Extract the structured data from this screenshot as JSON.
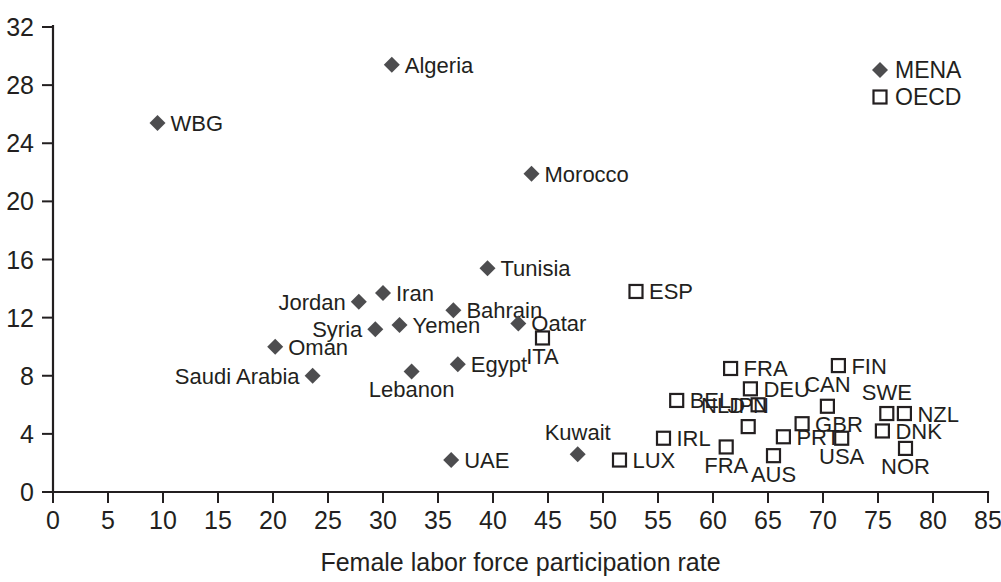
{
  "chart_data": {
    "type": "scatter",
    "title": "",
    "xlabel": "Female labor force participation rate",
    "ylabel": "",
    "xlim": [
      0,
      85
    ],
    "ylim": [
      0,
      32
    ],
    "xticks": [
      0,
      5,
      10,
      15,
      20,
      25,
      30,
      35,
      40,
      45,
      50,
      55,
      60,
      65,
      70,
      75,
      80,
      85
    ],
    "yticks": [
      0,
      4,
      8,
      12,
      16,
      20,
      24,
      28,
      32
    ],
    "grid": false,
    "legend_position": "top-right",
    "colors": {
      "mena_marker": "#4d4d4f",
      "oecd_marker_fill": "#ffffff",
      "oecd_marker_stroke": "#231f20",
      "axis": "#231f20",
      "text": "#231f20",
      "background": "#ffffff"
    },
    "series": [
      {
        "name": "MENA",
        "marker": "filled-diamond",
        "points": [
          {
            "label": "Algeria",
            "x": 30.8,
            "y": 29.4,
            "label_side": "right"
          },
          {
            "label": "WBG",
            "x": 9.5,
            "y": 25.4,
            "label_side": "right"
          },
          {
            "label": "Morocco",
            "x": 43.5,
            "y": 21.9,
            "label_side": "right"
          },
          {
            "label": "Tunisia",
            "x": 39.5,
            "y": 15.4,
            "label_side": "right"
          },
          {
            "label": "Iran",
            "x": 30.0,
            "y": 13.7,
            "label_side": "right"
          },
          {
            "label": "Jordan",
            "x": 27.8,
            "y": 13.1,
            "label_side": "left"
          },
          {
            "label": "Bahrain",
            "x": 36.4,
            "y": 12.5,
            "label_side": "right"
          },
          {
            "label": "Yemen",
            "x": 31.5,
            "y": 11.5,
            "label_side": "right"
          },
          {
            "label": "Qatar",
            "x": 42.3,
            "y": 11.6,
            "label_side": "right"
          },
          {
            "label": "Syria",
            "x": 29.3,
            "y": 11.2,
            "label_side": "left"
          },
          {
            "label": "Oman",
            "x": 20.2,
            "y": 10.0,
            "label_side": "right"
          },
          {
            "label": "Egypt",
            "x": 36.8,
            "y": 8.8,
            "label_side": "right"
          },
          {
            "label": "Saudi Arabia",
            "x": 23.6,
            "y": 8.0,
            "label_side": "left"
          },
          {
            "label": "Lebanon",
            "x": 32.6,
            "y": 8.3,
            "label_side": "below"
          },
          {
            "label": "Kuwait",
            "x": 47.7,
            "y": 2.6,
            "label_side": "above"
          },
          {
            "label": "UAE",
            "x": 36.2,
            "y": 2.2,
            "label_side": "right"
          }
        ]
      },
      {
        "name": "OECD",
        "marker": "open-square",
        "points": [
          {
            "label": "ESP",
            "x": 53.0,
            "y": 13.8,
            "label_side": "right"
          },
          {
            "label": "ITA",
            "x": 44.5,
            "y": 10.6,
            "label_side": "below"
          },
          {
            "label": "FIN",
            "x": 71.4,
            "y": 8.7,
            "label_side": "right"
          },
          {
            "label": "FRA",
            "x": 61.6,
            "y": 8.5,
            "label_side": "right"
          },
          {
            "label": "DEU",
            "x": 63.4,
            "y": 7.1,
            "label_side": "right"
          },
          {
            "label": "BEL",
            "x": 56.7,
            "y": 6.3,
            "label_side": "right"
          },
          {
            "label": "NLD",
            "x": 64.1,
            "y": 6.0,
            "label_side": "left"
          },
          {
            "label": "CAN",
            "x": 70.4,
            "y": 5.9,
            "label_side": "above"
          },
          {
            "label": "SWE",
            "x": 75.8,
            "y": 5.4,
            "label_side": "above"
          },
          {
            "label": "NZL",
            "x": 77.4,
            "y": 5.4,
            "label_side": "right"
          },
          {
            "label": "GBR",
            "x": 68.1,
            "y": 4.7,
            "label_side": "right"
          },
          {
            "label": "JPN",
            "x": 63.2,
            "y": 4.5,
            "label_side": "above"
          },
          {
            "label": "DNK",
            "x": 75.4,
            "y": 4.2,
            "label_side": "right"
          },
          {
            "label": "PRT",
            "x": 66.4,
            "y": 3.8,
            "label_side": "right"
          },
          {
            "label": "USA",
            "x": 71.7,
            "y": 3.7,
            "label_side": "below"
          },
          {
            "label": "IRL",
            "x": 55.5,
            "y": 3.7,
            "label_side": "right"
          },
          {
            "label": "FRA",
            "x": 61.2,
            "y": 3.1,
            "label_side": "below"
          },
          {
            "label": "NOR",
            "x": 77.5,
            "y": 3.0,
            "label_side": "below"
          },
          {
            "label": "AUS",
            "x": 65.5,
            "y": 2.5,
            "label_side": "below"
          },
          {
            "label": "LUX",
            "x": 51.5,
            "y": 2.2,
            "label_side": "right"
          }
        ]
      }
    ],
    "legend": [
      {
        "label": "MENA",
        "marker": "filled-diamond"
      },
      {
        "label": "OECD",
        "marker": "open-square"
      }
    ]
  }
}
